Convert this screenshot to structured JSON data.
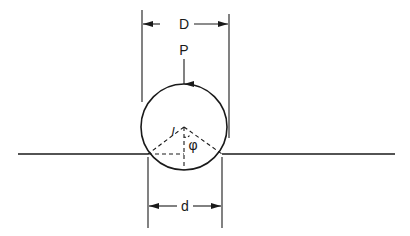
{
  "figure": {
    "type": "engineering-diagram",
    "colors": {
      "stroke": "#1a1a1a",
      "background": "#ffffff"
    }
  },
  "labels": {
    "diameter_sphere": "D",
    "load": "P",
    "slant_length": "l",
    "angle": "φ",
    "diameter_hole": "d"
  },
  "geometry": {
    "circle_center": [
      184,
      127
    ],
    "circle_radius": 43,
    "ground_y": 154,
    "ground_left": [
      18,
      148
    ],
    "ground_right": [
      222,
      395
    ],
    "D_extension_x": [
      142,
      229
    ],
    "D_dimension_y": 24,
    "d_extension_x": [
      148,
      222
    ],
    "d_dimension_y": 206
  }
}
